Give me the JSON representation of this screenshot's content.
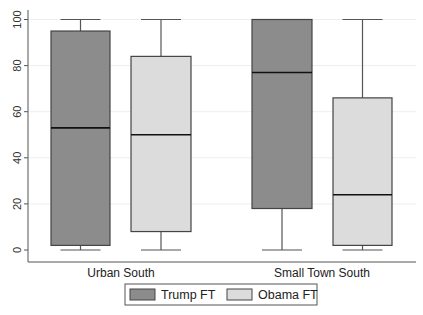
{
  "chart_data": {
    "type": "box",
    "title": "",
    "xlabel": "",
    "ylabel": "",
    "ylim": [
      0,
      100
    ],
    "yticks": [
      0,
      20,
      40,
      60,
      80,
      100
    ],
    "ytick_labels": [
      "0",
      "20",
      "40",
      "60",
      "80",
      "100"
    ],
    "grid": true,
    "categories": [
      "Urban South",
      "Small Town South"
    ],
    "legend_position": "bottom",
    "series": [
      {
        "name": "Trump FT",
        "color": "#8c8c8c",
        "boxes": [
          {
            "category": "Urban South",
            "min": 0,
            "q1": 2,
            "median": 53,
            "q3": 95,
            "max": 100
          },
          {
            "category": "Small Town South",
            "min": 0,
            "q1": 18,
            "median": 77,
            "q3": 100,
            "max": 100
          }
        ]
      },
      {
        "name": "Obama FT",
        "color": "#dcdcdc",
        "boxes": [
          {
            "category": "Urban South",
            "min": 0,
            "q1": 8,
            "median": 50,
            "q3": 84,
            "max": 100
          },
          {
            "category": "Small Town South",
            "min": 0,
            "q1": 2,
            "median": 24,
            "q3": 66,
            "max": 100
          }
        ]
      }
    ]
  },
  "legend": {
    "items": [
      {
        "label": "Trump FT",
        "color": "#8c8c8c"
      },
      {
        "label": "Obama FT",
        "color": "#dcdcdc"
      }
    ]
  }
}
